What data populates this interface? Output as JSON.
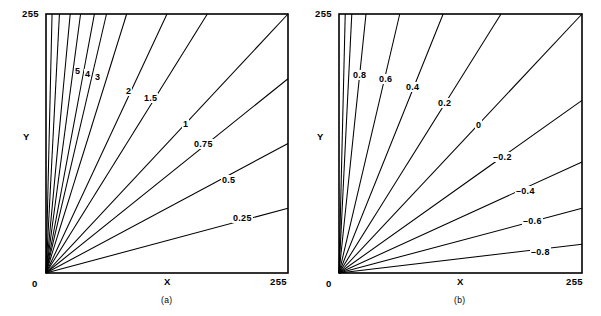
{
  "figure": {
    "width": 601,
    "height": 316,
    "background": "#ffffff",
    "ink_color": "#000000"
  },
  "panels": [
    {
      "id": "a",
      "caption": "(a)",
      "axis": {
        "x_label": "X",
        "y_label": "Y",
        "origin_label": "0",
        "x_max_label": "255",
        "y_max_label": "255"
      }
    },
    {
      "id": "b",
      "caption": "(b)",
      "axis": {
        "x_label": "X",
        "y_label": "Y",
        "origin_label": "0",
        "x_max_label": "255",
        "y_max_label": "255"
      }
    }
  ],
  "chart_data": [
    {
      "type": "line",
      "panel": "a",
      "title": "",
      "subtitle": "(a)",
      "xlabel": "X",
      "ylabel": "Y",
      "xlim": [
        0,
        255
      ],
      "ylim": [
        0,
        255
      ],
      "xticks": [
        0,
        255
      ],
      "xticklabels": [
        "0",
        "255"
      ],
      "yticks": [
        0,
        255
      ],
      "yticklabels": [
        "0",
        "255"
      ],
      "grid": false,
      "legend": "none",
      "description": "Family of rays from the origin; each ray is a contour of constant ratio Y/X, labelled with its ratio value.",
      "contour_quantity": "Y / X",
      "series": [
        {
          "name": "0.25",
          "label": "0.25",
          "value": 0.25,
          "slope": 0.25,
          "labeled": true,
          "label_x": 232,
          "label_y": 213
        },
        {
          "name": "0.5",
          "label": "0.5",
          "value": 0.5,
          "slope": 0.5,
          "labeled": true,
          "label_x": 221,
          "label_y": 175
        },
        {
          "name": "0.75",
          "label": "0.75",
          "value": 0.75,
          "slope": 0.75,
          "labeled": true,
          "label_x": 193,
          "label_y": 139
        },
        {
          "name": "1",
          "label": "1",
          "value": 1,
          "slope": 1.0,
          "labeled": true,
          "label_x": 182,
          "label_y": 119
        },
        {
          "name": "1.5",
          "label": "1.5",
          "value": 1.5,
          "slope": 1.5,
          "labeled": true,
          "label_x": 143,
          "label_y": 93
        },
        {
          "name": "2",
          "label": "2",
          "value": 2,
          "slope": 2.0,
          "labeled": true,
          "label_x": 125,
          "label_y": 86
        },
        {
          "name": "3",
          "label": "3",
          "value": 3,
          "slope": 3.0,
          "labeled": true,
          "label_x": 94,
          "label_y": 72
        },
        {
          "name": "4",
          "label": "4",
          "value": 4,
          "slope": 4.0,
          "labeled": true,
          "label_x": 84,
          "label_y": 69
        },
        {
          "name": "5",
          "label": "5",
          "value": 5,
          "slope": 5.0,
          "labeled": true,
          "label_x": 74,
          "label_y": 66
        },
        {
          "name": "7",
          "label": "",
          "value": 7,
          "slope": 7.0,
          "labeled": false,
          "label_x": 0,
          "label_y": 0
        },
        {
          "name": "10",
          "label": "",
          "value": 10,
          "slope": 10.0,
          "labeled": false,
          "label_x": 0,
          "label_y": 0
        },
        {
          "name": "18",
          "label": "",
          "value": 18,
          "slope": 18.0,
          "labeled": false,
          "label_x": 0,
          "label_y": 0
        },
        {
          "name": "40",
          "label": "",
          "value": 40,
          "slope": 40.0,
          "labeled": false,
          "label_x": 0,
          "label_y": 0
        }
      ]
    },
    {
      "type": "line",
      "panel": "b",
      "title": "",
      "subtitle": "(b)",
      "xlabel": "X",
      "ylabel": "Y",
      "xlim": [
        0,
        255
      ],
      "ylim": [
        0,
        255
      ],
      "xticks": [
        0,
        255
      ],
      "xticklabels": [
        "0",
        "255"
      ],
      "yticks": [
        0,
        255
      ],
      "yticklabels": [
        "0",
        "255"
      ],
      "grid": false,
      "legend": "none",
      "description": "Family of rays from the origin; each ray is a contour of constant normalized difference (Y - X)/(Y + X), labelled with its value.",
      "contour_quantity": "(Y - X) / (Y + X)",
      "series": [
        {
          "name": "-0.8",
          "label": "–0.8",
          "value": -0.8,
          "slope": 0.1111,
          "labeled": true,
          "label_x": 530,
          "label_y": 247
        },
        {
          "name": "-0.6",
          "label": "–0.6",
          "value": -0.6,
          "slope": 0.25,
          "labeled": true,
          "label_x": 522,
          "label_y": 216
        },
        {
          "name": "-0.4",
          "label": "–0.4",
          "value": -0.4,
          "slope": 0.4286,
          "labeled": true,
          "label_x": 515,
          "label_y": 186
        },
        {
          "name": "-0.2",
          "label": "–0.2",
          "value": -0.2,
          "slope": 0.6667,
          "labeled": true,
          "label_x": 492,
          "label_y": 152
        },
        {
          "name": "0",
          "label": "0",
          "value": 0,
          "slope": 1.0,
          "labeled": true,
          "label_x": 475,
          "label_y": 120
        },
        {
          "name": "0.2",
          "label": "0.2",
          "value": 0.2,
          "slope": 1.5,
          "labeled": true,
          "label_x": 437,
          "label_y": 98
        },
        {
          "name": "0.4",
          "label": "0.4",
          "value": 0.4,
          "slope": 2.3333,
          "labeled": true,
          "label_x": 405,
          "label_y": 82
        },
        {
          "name": "0.6",
          "label": "0.6",
          "value": 0.6,
          "slope": 4.0,
          "labeled": true,
          "label_x": 378,
          "label_y": 74
        },
        {
          "name": "0.8",
          "label": "0.8",
          "value": 0.8,
          "slope": 9.0,
          "labeled": true,
          "label_x": 352,
          "label_y": 70
        },
        {
          "name": "0.9",
          "label": "",
          "value": 0.9,
          "slope": 19.0,
          "labeled": false,
          "label_x": 0,
          "label_y": 0
        },
        {
          "name": "0.95",
          "label": "",
          "value": 0.95,
          "slope": 39.0,
          "labeled": false,
          "label_x": 0,
          "label_y": 0
        }
      ]
    }
  ]
}
